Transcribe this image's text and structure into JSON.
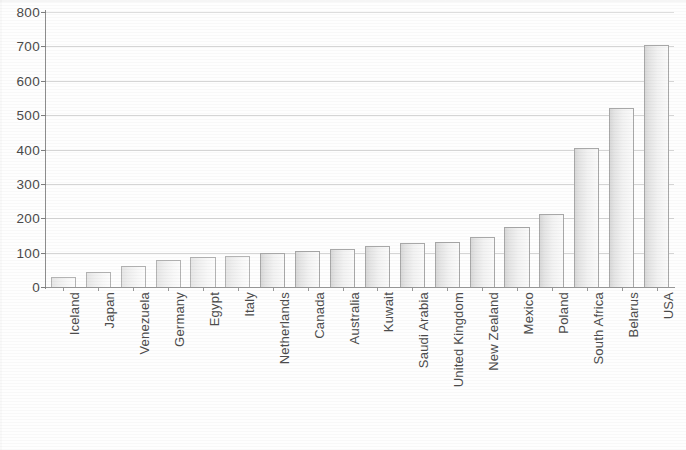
{
  "chart_data": {
    "type": "bar",
    "title": "",
    "subtitle": "",
    "xlabel": "",
    "ylabel": "",
    "ylim": [
      0,
      800
    ],
    "y_ticks": [
      0,
      100,
      200,
      300,
      400,
      500,
      600,
      700,
      800
    ],
    "y_tick_labels": [
      "0",
      "100",
      "200",
      "300",
      "400",
      "500",
      "600",
      "700",
      "800"
    ],
    "grid": true,
    "grid_axis": "y",
    "legend": false,
    "legend_position": "none",
    "x_tick_label_rotation": -90,
    "bar_color": "#eeeeee",
    "bar_edge_color": "#a8a8a8",
    "categories": [
      "Iceland",
      "Japan",
      "Venezuela",
      "Germany",
      "Egypt",
      "Italy",
      "Netherlands",
      "Canada",
      "Australia",
      "Kuwait",
      "Saudi Arabia",
      "United Kingdom",
      "New Zealand",
      "Mexico",
      "Poland",
      "South Africa",
      "Belarus",
      "USA"
    ],
    "values": [
      30,
      45,
      62,
      80,
      87,
      90,
      100,
      105,
      110,
      120,
      128,
      132,
      145,
      175,
      212,
      405,
      520,
      705
    ]
  }
}
